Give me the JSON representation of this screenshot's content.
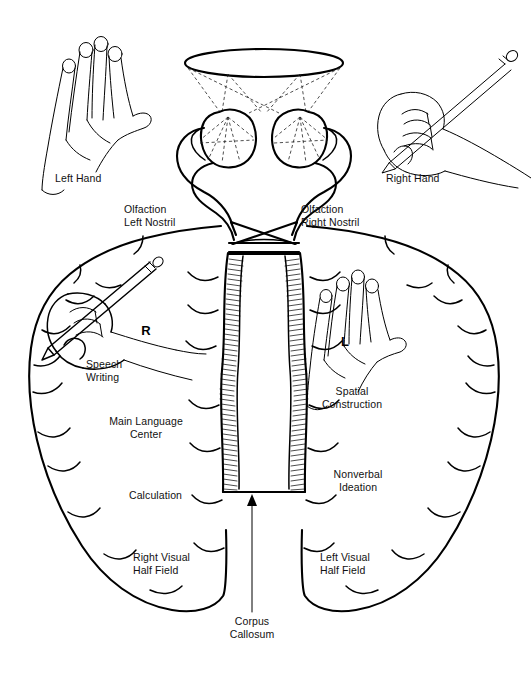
{
  "figure": {
    "background_color": "#ffffff",
    "ink_color": "#000000",
    "width": 531,
    "height": 684
  },
  "labels": {
    "left_hand": "Left Hand",
    "right_hand": "Right Hand",
    "olfaction_left_nostril": "Olfaction\nLeft Nostril",
    "olfaction_right_nostril": "Olfaction\nRight Nostril",
    "speech_writing": "Speech\nWriting",
    "main_language_center": "Main Language\nCenter",
    "calculation": "Calculation",
    "right_visual_half_field": "Right Visual\nHalf Field",
    "spatial_construction": "Spatial\nConstruction",
    "nonverbal_ideation": "Nonverbal\nIdeation",
    "left_visual_half_field": "Left Visual\nHalf Field",
    "corpus_callosum": "Corpus\nCallosum",
    "hemisphere_right": "R",
    "hemisphere_left": "L"
  },
  "label_positions": {
    "left_hand": {
      "x": 55,
      "y": 178,
      "align": "left"
    },
    "right_hand": {
      "x": 386,
      "y": 178,
      "align": "left"
    },
    "olfaction_left_nostril": {
      "x": 124,
      "y": 208,
      "align": "left"
    },
    "olfaction_right_nostril": {
      "x": 301,
      "y": 208,
      "align": "left"
    },
    "speech_writing": {
      "x": 86,
      "y": 363,
      "align": "left"
    },
    "main_language_center": {
      "x": 146,
      "y": 420,
      "align": "center"
    },
    "calculation": {
      "x": 144,
      "y": 494,
      "align": "left"
    },
    "right_visual_half_field": {
      "x": 133,
      "y": 556,
      "align": "left"
    },
    "spatial_construction": {
      "x": 352,
      "y": 390,
      "align": "center"
    },
    "nonverbal_ideation": {
      "x": 358,
      "y": 473,
      "align": "center"
    },
    "left_visual_half_field": {
      "x": 320,
      "y": 556,
      "align": "left"
    },
    "corpus_callosum": {
      "x": 252,
      "y": 620,
      "align": "center"
    },
    "hemisphere_right": {
      "x": 146,
      "y": 330
    },
    "hemisphere_left": {
      "x": 345,
      "y": 341
    }
  },
  "anatomy_parts": [
    {
      "name": "visual-field-ellipse",
      "description": "Horizontal ellipse representing the total visual field at top"
    },
    {
      "name": "crossed-sight-lines",
      "description": "Dashed lines crossing from visual field halves to each eye"
    },
    {
      "name": "left-eye",
      "description": "Left eyeball with dashed internal projection rays"
    },
    {
      "name": "right-eye",
      "description": "Right eyeball with dashed internal projection rays"
    },
    {
      "name": "optic-nerve-left",
      "description": "Optic nerve from left eye"
    },
    {
      "name": "optic-nerve-right",
      "description": "Optic nerve from right eye"
    },
    {
      "name": "optic-chiasm",
      "description": "X shaped crossing of optic nerve fibers"
    },
    {
      "name": "corpus-callosum-band",
      "description": "Hatched vertical band of commissural fibers joining hemispheres"
    },
    {
      "name": "brain-outline-left-hemisphere",
      "description": "Left-of-image cerebral hemisphere outline with sulci"
    },
    {
      "name": "brain-outline-right-hemisphere",
      "description": "Right-of-image cerebral hemisphere outline with sulci"
    },
    {
      "name": "hand-left-outer",
      "description": "Open left hand illustration, upper left"
    },
    {
      "name": "hand-right-outer-with-pencil",
      "description": "Right hand gripping pencil, upper right"
    },
    {
      "name": "hand-right-inner-with-pencil",
      "description": "Writing hand with pencil drawn inside the left hemisphere"
    },
    {
      "name": "hand-left-inner",
      "description": "Open hand drawn inside the right hemisphere"
    },
    {
      "name": "corpus-callosum-pointer-arrow",
      "description": "Vertical arrow pointing up to corpus callosum"
    }
  ]
}
